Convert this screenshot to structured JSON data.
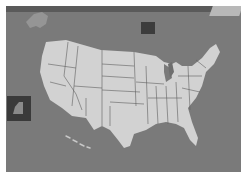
{
  "scene": {
    "description": "Grayscale photo of a United States map board with state borders",
    "colors": {
      "background": "#7a7a7a",
      "land": "#d2d2d2",
      "borders": "#555555",
      "dark_tile": "#3c3c3c",
      "frame": "#ffffff"
    },
    "elements": [
      {
        "name": "contiguous-us-map"
      },
      {
        "name": "alaska-shape"
      },
      {
        "name": "dark-square-tile"
      },
      {
        "name": "left-inset-frame"
      },
      {
        "name": "hawaii-islands"
      }
    ]
  }
}
